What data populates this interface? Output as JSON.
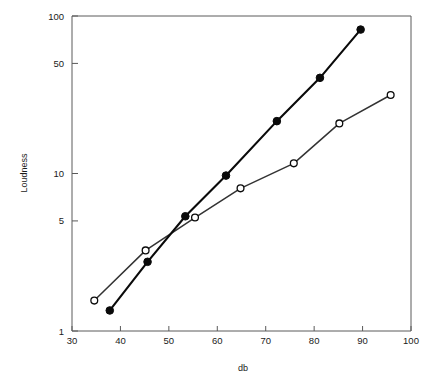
{
  "chart_data": {
    "type": "line",
    "title": "",
    "xlabel": "db",
    "ylabel": "Loudness",
    "xscale": "linear",
    "yscale": "log",
    "xlim": [
      30,
      100
    ],
    "ylim": [
      1,
      100
    ],
    "grid": false,
    "legend": "none",
    "xticks": [
      30,
      40,
      50,
      60,
      70,
      80,
      90,
      100
    ],
    "xtick_labels": [
      "30",
      "40",
      "50",
      "60",
      "70",
      "80",
      "90",
      "100"
    ],
    "yticks": [
      1,
      5,
      10,
      50,
      100
    ],
    "ytick_labels": [
      "1",
      "5",
      "10",
      "50",
      "100"
    ],
    "series": [
      {
        "name": "filled-circles",
        "marker": "filled circle",
        "marker_color": "#0a0a0a",
        "line_color": "#0a0a0a",
        "points": [
          {
            "x": 37.8,
            "y": 1.35
          },
          {
            "x": 45.6,
            "y": 2.75
          },
          {
            "x": 53.4,
            "y": 5.35
          },
          {
            "x": 61.8,
            "y": 9.7
          },
          {
            "x": 72.3,
            "y": 21.5
          },
          {
            "x": 81.2,
            "y": 40.5
          },
          {
            "x": 89.6,
            "y": 82.0
          }
        ]
      },
      {
        "name": "open-circles",
        "marker": "open circle",
        "marker_color": "#ffffff",
        "line_color": "#333333",
        "points": [
          {
            "x": 34.6,
            "y": 1.56
          },
          {
            "x": 45.2,
            "y": 3.25
          },
          {
            "x": 55.4,
            "y": 5.25
          },
          {
            "x": 64.8,
            "y": 8.05
          },
          {
            "x": 75.8,
            "y": 11.6
          },
          {
            "x": 85.2,
            "y": 20.8
          },
          {
            "x": 95.8,
            "y": 31.5
          }
        ]
      }
    ]
  },
  "axes": {
    "x_axis_title": "db",
    "y_axis_title": "Loudness"
  }
}
